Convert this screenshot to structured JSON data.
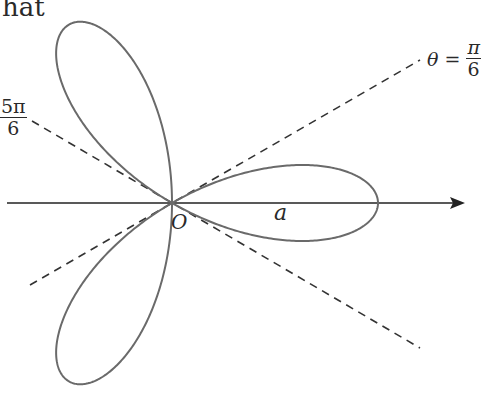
{
  "header_fragment": "hat",
  "labels": {
    "theta_eq": "θ =",
    "pi_over_6_num": "π",
    "pi_over_6_den": "6",
    "five_pi_num": "5π",
    "five_pi_den": "6",
    "origin": "O",
    "radius": "a"
  },
  "diagram": {
    "curve": "r = a cos 3θ (three-petal rose)",
    "origin_px": [
      172,
      203
    ],
    "a_px": 206,
    "petal_angles_deg": [
      0,
      120,
      240
    ],
    "dashed_lines_deg": [
      30,
      150
    ],
    "colors": {
      "curve": "#6a6a6a",
      "axis": "#222222",
      "dashed": "#333333"
    }
  }
}
